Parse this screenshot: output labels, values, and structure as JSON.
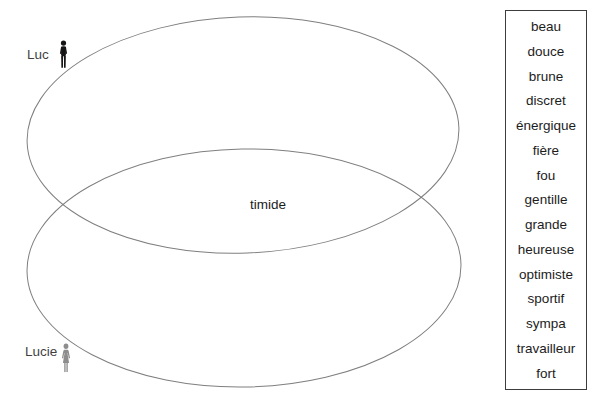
{
  "diagram": {
    "set_a": {
      "label": "Luc",
      "icon": "man-icon"
    },
    "set_b": {
      "label": "Lucie",
      "icon": "woman-icon"
    },
    "intersection_word": "timide"
  },
  "word_bank": {
    "words": [
      "beau",
      "douce",
      "brune",
      "discret",
      "énergique",
      "fière",
      "fou",
      "gentille",
      "grande",
      "heureuse",
      "optimiste",
      "sportif",
      "sympa",
      "travailleur",
      "fort"
    ]
  },
  "colors": {
    "background": "#ffffff",
    "ellipse-stroke": "#7f7f7f",
    "box-border": "#3d3d3d",
    "word-text": "#1c1c1c",
    "label-text": "#3f3f3f",
    "man-icon": "#151515",
    "woman-icon": "#8d8d8d"
  }
}
